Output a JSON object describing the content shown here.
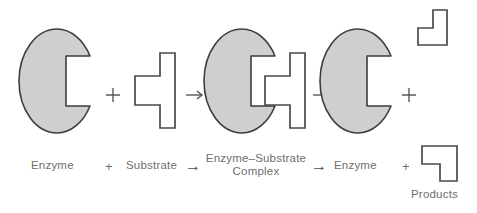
{
  "diagram": {
    "type": "enzyme-substrate-reaction",
    "title": "",
    "colors": {
      "enzyme_fill": "#cfcfcf",
      "enzyme_stroke": "#3d3d3d",
      "substrate_fill": "#ffffff",
      "substrate_stroke": "#4a4a4a",
      "product_fill": "#ffffff",
      "product_stroke": "#4a4a4a",
      "label_text": "#6e6e6e",
      "background": "#ffffff"
    },
    "shapes": [
      {
        "id": "enzyme-1",
        "name": "enzyme",
        "kind": "notched-ellipse",
        "fill": "#cfcfcf"
      },
      {
        "id": "substrate-1",
        "name": "substrate",
        "kind": "substrate-polygon",
        "fill": "#ffffff"
      },
      {
        "id": "complex-1",
        "name": "enzyme-substrate-complex",
        "kind": "notched-ellipse-with-substrate",
        "fill": "#cfcfcf"
      },
      {
        "id": "enzyme-2",
        "name": "enzyme",
        "kind": "notched-ellipse",
        "fill": "#cfcfcf"
      },
      {
        "id": "product-top",
        "name": "product",
        "kind": "l-shape",
        "fill": "#ffffff"
      },
      {
        "id": "product-bottom",
        "name": "product",
        "kind": "l-shape",
        "fill": "#ffffff"
      }
    ],
    "operators": {
      "plus": "+",
      "arrow": "→"
    },
    "labels": {
      "enzyme_1": "Enzyme",
      "plus_1": "+",
      "substrate": "Substrate",
      "arrow_1": "→",
      "complex_line1": "Enzyme–Substrate",
      "complex_line2": "Complex",
      "arrow_2": "→",
      "enzyme_2": "Enzyme",
      "plus_2": "+",
      "products": "Products"
    },
    "equation": "Enzyme + Substrate → Enzyme–Substrate Complex → Enzyme + Products"
  }
}
